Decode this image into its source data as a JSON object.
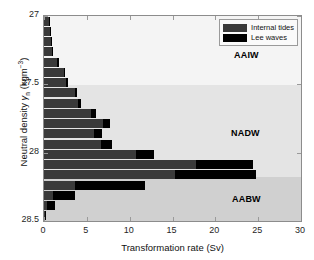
{
  "chart_data": {
    "type": "bar",
    "orientation": "horizontal",
    "title": "",
    "xlabel": "Transformation rate (Sv)",
    "ylabel": "Neutral density γn (kgm⁻³)",
    "xlim": [
      0,
      30
    ],
    "ylim": [
      28.5,
      27.0
    ],
    "y_inverted": true,
    "xticks": [
      0,
      5,
      10,
      15,
      20,
      25,
      30
    ],
    "xticklabels": [
      "0",
      "5",
      "10",
      "15",
      "20",
      "25",
      "30"
    ],
    "yticks": [
      27,
      27.5,
      28,
      28.5
    ],
    "yticklabels": [
      "27",
      "27.5",
      "28",
      "28.5"
    ],
    "grid": false,
    "legend_position": "upper right",
    "stacked": true,
    "bin_width": 0.075,
    "series": [
      {
        "name": "Internal tides",
        "color": "#3a3a3a"
      },
      {
        "name": "Lee waves",
        "color": "#000000"
      }
    ],
    "categories": [
      27.04,
      27.11,
      27.19,
      27.26,
      27.34,
      27.41,
      27.49,
      27.56,
      27.64,
      27.71,
      27.79,
      27.86,
      27.94,
      28.01,
      28.09,
      28.16,
      28.24,
      28.31,
      28.39,
      28.46
    ],
    "bars": [
      {
        "y": 27.04,
        "internal_tides": 0.55,
        "lee_waves": 0.1,
        "total": 0.65
      },
      {
        "y": 27.11,
        "internal_tides": 0.7,
        "lee_waves": 0.1,
        "total": 0.8
      },
      {
        "y": 27.19,
        "internal_tides": 0.85,
        "lee_waves": 0.1,
        "total": 0.95
      },
      {
        "y": 27.26,
        "internal_tides": 0.9,
        "lee_waves": 0.15,
        "total": 1.05
      },
      {
        "y": 27.34,
        "internal_tides": 1.55,
        "lee_waves": 0.15,
        "total": 1.7
      },
      {
        "y": 27.41,
        "internal_tides": 2.3,
        "lee_waves": 0.15,
        "total": 2.45
      },
      {
        "y": 27.49,
        "internal_tides": 2.6,
        "lee_waves": 0.2,
        "total": 2.8
      },
      {
        "y": 27.56,
        "internal_tides": 3.6,
        "lee_waves": 0.25,
        "total": 3.85
      },
      {
        "y": 27.64,
        "internal_tides": 4.0,
        "lee_waves": 0.35,
        "total": 4.35
      },
      {
        "y": 27.71,
        "internal_tides": 5.5,
        "lee_waves": 0.55,
        "total": 6.05
      },
      {
        "y": 27.79,
        "internal_tides": 6.9,
        "lee_waves": 0.85,
        "total": 7.75
      },
      {
        "y": 27.86,
        "internal_tides": 5.8,
        "lee_waves": 0.95,
        "total": 6.75
      },
      {
        "y": 27.94,
        "internal_tides": 6.7,
        "lee_waves": 1.2,
        "total": 7.9
      },
      {
        "y": 28.01,
        "internal_tides": 10.7,
        "lee_waves": 2.1,
        "total": 12.8
      },
      {
        "y": 28.09,
        "internal_tides": 17.8,
        "lee_waves": 6.6,
        "total": 24.4
      },
      {
        "y": 28.16,
        "internal_tides": 15.3,
        "lee_waves": 9.5,
        "total": 24.8
      },
      {
        "y": 28.24,
        "internal_tides": 3.6,
        "lee_waves": 8.2,
        "total": 11.8
      },
      {
        "y": 28.31,
        "internal_tides": 1.1,
        "lee_waves": 2.5,
        "total": 3.6
      },
      {
        "y": 28.39,
        "internal_tides": 0.35,
        "lee_waves": 0.9,
        "total": 1.25
      },
      {
        "y": 28.46,
        "internal_tides": 0.1,
        "lee_waves": 0.05,
        "total": 0.15
      }
    ],
    "annotations": [
      {
        "text": "AAIW",
        "y_range": [
          27.0,
          27.5
        ],
        "band_color": "#f4f4f4"
      },
      {
        "text": "NADW",
        "y_range": [
          27.5,
          28.17
        ],
        "band_color": "#e4e4e4"
      },
      {
        "text": "AABW",
        "y_range": [
          28.17,
          28.5
        ],
        "band_color": "#d0d0d0"
      }
    ]
  },
  "legend": {
    "items": [
      {
        "label": "Internal tides",
        "color": "#3a3a3a"
      },
      {
        "label": "Lee waves",
        "color": "#000000"
      }
    ]
  },
  "axes": {
    "xlabel": "Transformation rate (Sv)",
    "ylabel_prefix": "Neutral density ",
    "ylabel_symbol": "γ",
    "ylabel_sub": "n",
    "ylabel_units_open": " (kgm",
    "ylabel_sup": "−3",
    "ylabel_units_close": ")",
    "xticklabels": [
      "0",
      "5",
      "10",
      "15",
      "20",
      "25",
      "30"
    ],
    "yticklabels": [
      "27",
      "27.5",
      "28",
      "28.5"
    ]
  },
  "bands": {
    "aaiw": "AAIW",
    "nadw": "NADW",
    "aabw": "AABW"
  }
}
